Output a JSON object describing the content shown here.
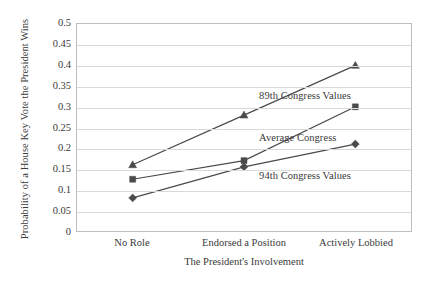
{
  "chart_data": {
    "type": "line",
    "title": "",
    "xlabel": "The President's Involvement",
    "ylabel": "Probability of a House Key Vote the President Wins",
    "categories": [
      "No Role",
      "Endorsed a Position",
      "Actively Lobbied"
    ],
    "ylim": [
      0,
      0.5
    ],
    "yticks": [
      0,
      0.05,
      0.1,
      0.15,
      0.2,
      0.25,
      0.3,
      0.35,
      0.4,
      0.45,
      0.5
    ],
    "ytick_labels": [
      "0",
      "0.05",
      "0.1",
      "0.15",
      "0.2",
      "0.25",
      "0.3",
      "0.35",
      "0.4",
      "0.45",
      "0.5"
    ],
    "grid": true,
    "legend_position": "inline-annotations",
    "series": [
      {
        "name": "89th Congress Values",
        "marker": "triangle",
        "color": "#4a4a4a",
        "values": [
          0.16,
          0.28,
          0.4
        ]
      },
      {
        "name": "Average Congress",
        "marker": "square",
        "color": "#4a4a4a",
        "values": [
          0.125,
          0.17,
          0.3
        ]
      },
      {
        "name": "94th Congress Values",
        "marker": "diamond",
        "color": "#4a4a4a",
        "values": [
          0.08,
          0.155,
          0.21
        ]
      }
    ],
    "annotations": [
      {
        "text": "89th Congress Values",
        "x_frac": 0.545,
        "y_value": 0.325
      },
      {
        "text": "Average Congress",
        "x_frac": 0.545,
        "y_value": 0.225
      },
      {
        "text": "94th Congress Values",
        "x_frac": 0.545,
        "y_value": 0.135
      }
    ]
  }
}
